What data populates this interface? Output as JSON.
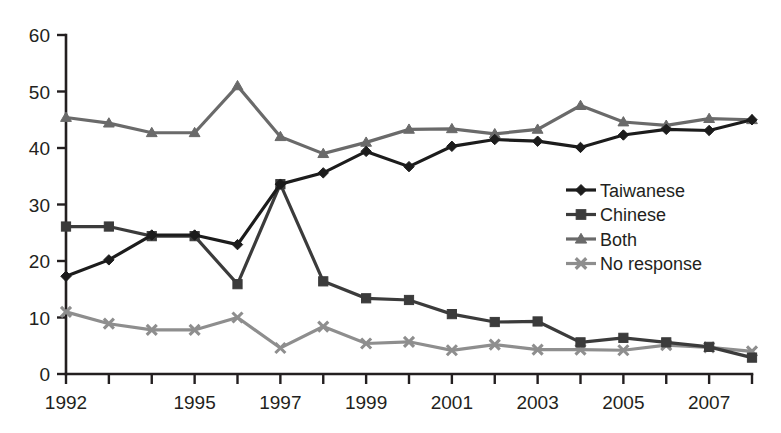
{
  "chart_data": {
    "type": "line",
    "title": "",
    "subtitle": "",
    "xlabel": "",
    "ylabel": "",
    "grid": false,
    "legend_position": "center-right",
    "xlim": [
      1992,
      2008
    ],
    "ylim": [
      0,
      60
    ],
    "y_ticks": [
      0,
      10,
      20,
      30,
      40,
      50,
      60
    ],
    "y_tick_labels": [
      "0",
      "10",
      "20",
      "30",
      "40",
      "50",
      "60"
    ],
    "x": [
      1992,
      1993,
      1994,
      1995,
      1996,
      1997,
      1998,
      1999,
      2000,
      2001,
      2002,
      2003,
      2004,
      2005,
      2006,
      2007,
      2008
    ],
    "x_tick_labels": [
      "1992",
      "",
      "",
      "1995",
      "",
      "1997",
      "",
      "1999",
      "",
      "2001",
      "",
      "2003",
      "",
      "2005",
      "",
      "2007",
      ""
    ],
    "x_labeled_ticks": [
      "1992",
      "1995",
      "1997",
      "1999",
      "2001",
      "2003",
      "2005",
      "2007"
    ],
    "series": [
      {
        "name": "Taiwanese",
        "color": "#1c1c1c",
        "marker": "diamond",
        "values": [
          17.3,
          20.2,
          24.6,
          24.6,
          22.9,
          33.6,
          35.6,
          39.4,
          36.7,
          40.3,
          41.5,
          41.2,
          40.1,
          42.3,
          43.3,
          43.1,
          45.0
        ]
      },
      {
        "name": "Chinese",
        "color": "#3b3b3b",
        "marker": "square",
        "values": [
          26.1,
          26.1,
          24.4,
          24.4,
          15.9,
          33.6,
          16.4,
          13.4,
          13.1,
          10.6,
          9.2,
          9.3,
          5.6,
          6.4,
          5.6,
          4.8,
          2.9
        ]
      },
      {
        "name": "Both",
        "color": "#6a6a6a",
        "marker": "triangle",
        "values": [
          45.4,
          44.4,
          42.7,
          42.7,
          51.0,
          42.0,
          39.0,
          41.0,
          43.3,
          43.4,
          42.5,
          43.3,
          47.5,
          44.6,
          44.0,
          45.2,
          45.0
        ]
      },
      {
        "name": "No response",
        "color": "#8e8e8e",
        "marker": "cross",
        "values": [
          11.0,
          8.9,
          7.8,
          7.8,
          10.0,
          4.6,
          8.4,
          5.4,
          5.7,
          4.2,
          5.2,
          4.3,
          4.3,
          4.2,
          5.1,
          4.7,
          4.0
        ]
      }
    ]
  },
  "legend": {
    "items": [
      {
        "label": "Taiwanese",
        "color": "#1c1c1c",
        "marker": "diamond"
      },
      {
        "label": "Chinese",
        "color": "#3b3b3b",
        "marker": "square"
      },
      {
        "label": "Both",
        "color": "#6a6a6a",
        "marker": "triangle"
      },
      {
        "label": "No response",
        "color": "#8e8e8e",
        "marker": "cross"
      }
    ]
  }
}
